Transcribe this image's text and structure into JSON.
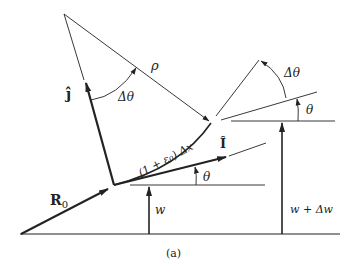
{
  "diagram": {
    "caption": "(a)",
    "labels": {
      "j_hat": "ĵ",
      "i_hat": "Î",
      "rho": "ρ",
      "delta_theta_left": "Δθ",
      "delta_theta_right": "Δθ",
      "arc_length": "(1 + ε₀) Δx",
      "theta_left": "θ",
      "theta_right": "θ",
      "R0": "R",
      "R0_sub": "0",
      "w": "w",
      "w_plus_dw": "w + Δw"
    },
    "colors": {
      "stroke": "#222222",
      "background": "#ffffff"
    }
  }
}
